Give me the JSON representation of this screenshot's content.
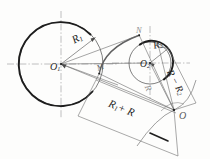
{
  "figure": {
    "kind": "engineering-geometry-construction",
    "background_color": "#fdfdfc",
    "ink_color": "#2b2b2b",
    "faint_ink_color": "#9a9a9a",
    "canvas": {
      "width": 210,
      "height": 159
    }
  },
  "labels": {
    "center_left": "O",
    "center_left_sub": "1",
    "center_right": "O",
    "center_right_sub": "2",
    "radius_left": "R",
    "radius_left_sub": "1",
    "radius_right": "R",
    "radius_right_sub": "2",
    "tangent_point_m": "M",
    "tangent_point_n": "N",
    "arc_center_o": "O",
    "dim_sum": "R",
    "dim_sum_sub": "1",
    "dim_sum_tail": "+ R",
    "dim_diff": "R − R",
    "dim_diff_sub": "2",
    "radius_arc": "R"
  },
  "geometry": {
    "circle_left": {
      "cx": 61,
      "cy": 64,
      "r": 42,
      "label": "O1",
      "radius_label": "R1"
    },
    "circle_right": {
      "cx": 150,
      "cy": 63,
      "r": 21,
      "label": "O2",
      "radius_label": "R2"
    },
    "arc_center": {
      "x": 174,
      "y": 110,
      "label": "O"
    },
    "tangent_point_m": {
      "x": 99,
      "y": 73
    },
    "tangent_point_n": {
      "x": 139,
      "y": 35
    },
    "dimension_sum": {
      "from": "O1",
      "to": "O",
      "text": "R1 + R"
    },
    "dimension_diff": {
      "from": "O",
      "to": "O2",
      "text": "R - R2"
    },
    "construction_radius": {
      "text": "R"
    }
  }
}
